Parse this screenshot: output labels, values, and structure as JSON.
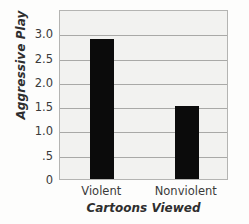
{
  "chart_data": {
    "type": "bar",
    "title": "",
    "categories": [
      "Violent",
      "Nonviolent"
    ],
    "values": [
      2.92,
      1.55
    ],
    "xlabel": "Cartoons Viewed",
    "ylabel": "Aggressive Play",
    "ylim": [
      0,
      3.5
    ],
    "yticks": [
      0,
      0.5,
      1.0,
      1.5,
      2.0,
      2.5,
      3.0
    ],
    "ytick_labels": [
      "0",
      ".5",
      "1.0",
      "1.5",
      "2.0",
      "2.5",
      "3.0"
    ],
    "grid": true,
    "gridlines_at": [
      0.5,
      1.0,
      1.5,
      2.0,
      2.5,
      3.0
    ],
    "legend": null,
    "bar_color": "#0b0b0b",
    "plot_background": "#f2f2f0",
    "frame_color": "#b4b4b2",
    "gridline_color": "#a9a9a7"
  }
}
